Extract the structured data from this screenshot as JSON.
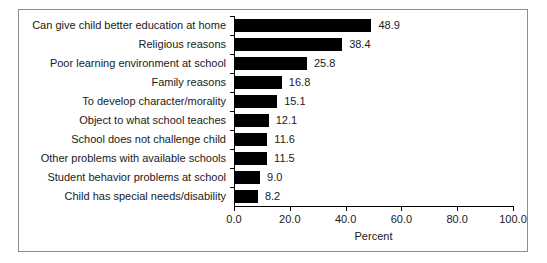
{
  "chart_data": {
    "type": "bar",
    "orientation": "horizontal",
    "title": "",
    "xlabel": "Percent",
    "ylabel": "",
    "xlim": [
      0.0,
      100.0
    ],
    "xticks": [
      "0.0",
      "20.0",
      "40.0",
      "60.0",
      "80.0",
      "100.0"
    ],
    "xtick_values": [
      0,
      20,
      40,
      60,
      80,
      100
    ],
    "grid": false,
    "legend": false,
    "bar_color": "#000000",
    "categories": [
      "Can give child better education at home",
      "Religious reasons",
      "Poor learning environment at school",
      "Family reasons",
      "To develop character/morality",
      "Object to what school teaches",
      "School does not challenge child",
      "Other problems with available schools",
      "Student behavior problems at school",
      "Child has special needs/disability"
    ],
    "values": [
      48.9,
      38.4,
      25.8,
      16.8,
      15.1,
      12.1,
      11.6,
      11.5,
      9.0,
      8.2
    ],
    "value_labels": [
      "48.9",
      "38.4",
      "25.8",
      "16.8",
      "15.1",
      "12.1",
      "11.6",
      "11.5",
      "9.0",
      "8.2"
    ]
  }
}
